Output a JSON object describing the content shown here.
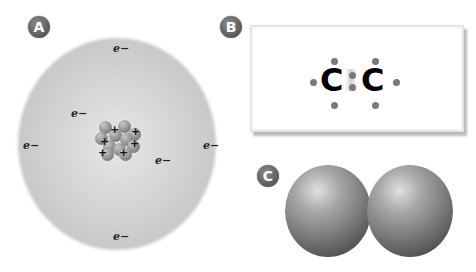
{
  "panels": {
    "a": {
      "label": "A",
      "title": "atom",
      "electron_label": "e−",
      "electron_count": 6,
      "nucleus_plus_signs": [
        "+",
        "+",
        "+",
        "+",
        "+",
        "+"
      ]
    },
    "b": {
      "label": "B",
      "title": "lewis-dot-structure",
      "atoms": [
        "C",
        "C"
      ]
    },
    "c": {
      "label": "C",
      "title": "space-filling-model"
    }
  },
  "colors": {
    "badge": "#5a5a5a",
    "electron_cloud": "#cfcfcf",
    "dot": "#7a7a7a",
    "sphere": "#7a7a7a"
  }
}
